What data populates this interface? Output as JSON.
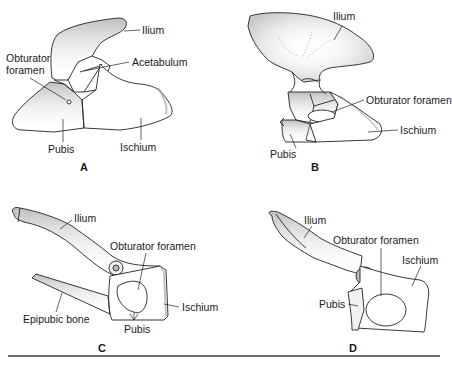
{
  "figure": {
    "panels": [
      {
        "id": "A",
        "letter": "A",
        "labels": {
          "ilium": "Ilium",
          "obturator_foramen_1": "Obturator",
          "obturator_foramen_2": "foramen",
          "acetabulum": "Acetabulum",
          "pubis": "Pubis",
          "ischium": "Ischium"
        }
      },
      {
        "id": "B",
        "letter": "B",
        "labels": {
          "ilium": "Ilium",
          "obturator_foramen": "Obturator foramen",
          "ischium": "Ischium",
          "pubis": "Pubis"
        }
      },
      {
        "id": "C",
        "letter": "C",
        "labels": {
          "ilium": "Ilium",
          "obturator_foramen": "Obturator foramen",
          "ischium": "Ischium",
          "epipubic_bone": "Epipubic bone",
          "pubis": "Pubis"
        }
      },
      {
        "id": "D",
        "letter": "D",
        "labels": {
          "ilium": "Ilium",
          "obturator_foramen": "Obturator foramen",
          "ischium": "Ischium",
          "pubis": "Pubis"
        }
      }
    ]
  },
  "colors": {
    "stroke": "#222222",
    "shade": "#bdbdbd",
    "rule": "#6e6e6e"
  }
}
